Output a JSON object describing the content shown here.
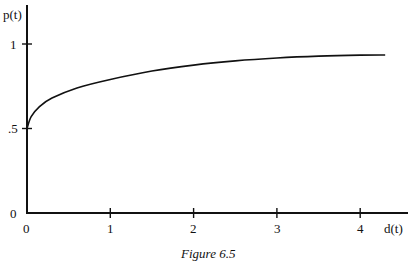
{
  "chart_data": {
    "type": "line",
    "title": "",
    "caption": "Figure 6.5",
    "xlabel": "d(t)",
    "ylabel": "p(t)",
    "xlim": [
      0,
      4.3
    ],
    "ylim": [
      0,
      1.0
    ],
    "x_ticks": [
      {
        "value": 0,
        "label": "0"
      },
      {
        "value": 1,
        "label": "1"
      },
      {
        "value": 2,
        "label": "2"
      },
      {
        "value": 3,
        "label": "3"
      },
      {
        "value": 4,
        "label": "4"
      }
    ],
    "y_ticks": [
      {
        "value": 0,
        "label": "0"
      },
      {
        "value": 0.5,
        "label": ".5"
      },
      {
        "value": 1,
        "label": "1"
      }
    ],
    "grid": false,
    "legend": null,
    "series": [
      {
        "name": "p(t)",
        "color": "#111111",
        "x": [
          0,
          0.05,
          0.15,
          0.3,
          0.6,
          1.0,
          1.5,
          2.0,
          2.5,
          3.0,
          3.5,
          4.0,
          4.3
        ],
        "values": [
          0.5,
          0.57,
          0.63,
          0.68,
          0.74,
          0.79,
          0.84,
          0.875,
          0.9,
          0.917,
          0.928,
          0.934,
          0.935
        ]
      }
    ]
  },
  "labels": {
    "ylabel": "p(t)",
    "xlabel": "d(t)",
    "y_tick_1": "1",
    "y_tick_half": ".5",
    "y_tick_0": "0",
    "x_tick_0": "0",
    "x_tick_1": "1",
    "x_tick_2": "2",
    "x_tick_3": "3",
    "x_tick_4": "4",
    "caption": "Figure 6.5"
  }
}
